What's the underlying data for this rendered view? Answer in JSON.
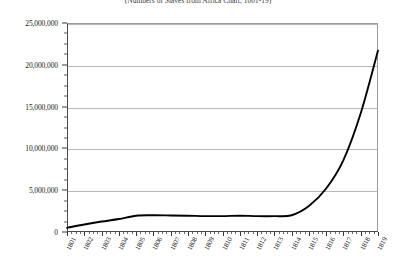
{
  "chart_data": {
    "type": "line",
    "title": "(Numbers of Slaves from Africa Chart, 1801-19)",
    "xlabel": "",
    "ylabel": "",
    "grid": true,
    "legend": false,
    "legend_position": "none",
    "line_color": "#000000",
    "gridline_color": "#b8b8b8",
    "axis_color": "#4a4a4a",
    "background_color": "#ffffff",
    "xlim": [
      1801,
      1819
    ],
    "ylim": [
      0,
      25000000
    ],
    "y_tick_step": 5000000,
    "y_minor_ticks_per_major": 4,
    "x_minor_ticks_per_major": 4,
    "categories": [
      "1801",
      "1802",
      "1803",
      "1804",
      "1805",
      "1806",
      "1807",
      "1808",
      "1809",
      "1810",
      "1811",
      "1812",
      "1813",
      "1814",
      "1815",
      "1816",
      "1817",
      "1818",
      "1819"
    ],
    "x": [
      1801,
      1802,
      1803,
      1804,
      1805,
      1806,
      1807,
      1808,
      1809,
      1810,
      1811,
      1812,
      1813,
      1814,
      1815,
      1816,
      1817,
      1818,
      1819
    ],
    "values": [
      500000,
      900000,
      1250000,
      1550000,
      1950000,
      2000000,
      1980000,
      1950000,
      1900000,
      1900000,
      1950000,
      1900000,
      1900000,
      2000000,
      3100000,
      5200000,
      8600000,
      14200000,
      21700000
    ],
    "ytick_labels": [
      "0",
      "5,000,000",
      "10,000,000",
      "15,000,000",
      "20,000,000",
      "25,000,000"
    ],
    "ytick_values": [
      0,
      5000000,
      10000000,
      15000000,
      20000000,
      25000000
    ]
  }
}
